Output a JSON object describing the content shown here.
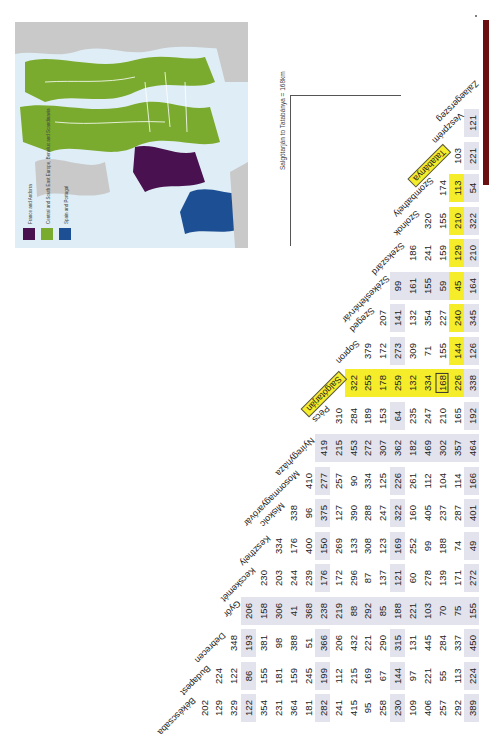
{
  "map": {
    "legend": [
      {
        "label": "France and Andorra",
        "color": "#4a1150"
      },
      {
        "label": "Central and South East Europe, Benelux and Scandinavia",
        "color": "#7aab2e"
      },
      {
        "label": "Spain and Portugal",
        "color": "#1d4f94"
      }
    ],
    "sea_color": "#dfeef6",
    "land_color": "#c9c9c9"
  },
  "note": "Salgótarján to Tatabánya = 168km",
  "accent_colors": {
    "highlight": "#f5ec2a",
    "band": "#e3e3ee",
    "bar": "#6b1010"
  },
  "table": {
    "cities": [
      "Békéscsaba",
      "Budapest",
      "Debrecen",
      "Győr",
      "Kecskemét",
      "Keszthely",
      "Miskolc",
      "Mosonmagyaróvár",
      "Nyíregyháza",
      "Pécs",
      "Salgótarján",
      "Sopron",
      "Szeged",
      "Székesfehérvár",
      "Szekszárd",
      "Szolnok",
      "Szombathely",
      "Tatabánya",
      "Veszprém",
      "Zalaegerszeg"
    ],
    "columns": [
      {
        "city": "Békéscsaba",
        "values": [
          "202",
          "129",
          "329",
          "122",
          "354",
          "231",
          "364",
          "181",
          "282",
          "241",
          "415",
          "95",
          "258",
          "230",
          "109",
          "406",
          "257",
          "292",
          "389"
        ]
      },
      {
        "city": "Budapest",
        "values": [
          "224",
          "122",
          "86",
          "155",
          "181",
          "159",
          "245",
          "199",
          "112",
          "215",
          "169",
          "67",
          "144",
          "97",
          "221",
          "55",
          "113",
          "224"
        ]
      },
      {
        "city": "Debrecen",
        "values": [
          "348",
          "193",
          "381",
          "98",
          "388",
          "51",
          "366",
          "206",
          "432",
          "221",
          "290",
          "315",
          "131",
          "445",
          "284",
          "337",
          "450"
        ]
      },
      {
        "city": "Győr",
        "values": [
          "206",
          "158",
          "306",
          "41",
          "368",
          "238",
          "219",
          "88",
          "292",
          "85",
          "188",
          "221",
          "103",
          "70",
          "75",
          "155"
        ]
      },
      {
        "city": "Kecskemét",
        "values": [
          "230",
          "203",
          "244",
          "239",
          "176",
          "172",
          "296",
          "87",
          "137",
          "121",
          "60",
          "278",
          "139",
          "171",
          "272"
        ]
      },
      {
        "city": "Keszthely",
        "values": [
          "334",
          "176",
          "400",
          "150",
          "269",
          "133",
          "308",
          "123",
          "169",
          "252",
          "99",
          "188",
          "74",
          "49"
        ]
      },
      {
        "city": "Miskolc",
        "values": [
          "338",
          "96",
          "375",
          "127",
          "390",
          "288",
          "247",
          "322",
          "160",
          "405",
          "237",
          "287",
          "401"
        ]
      },
      {
        "city": "Mosonmagyaróvár",
        "values": [
          "410",
          "277",
          "257",
          "90",
          "334",
          "125",
          "226",
          "261",
          "112",
          "104",
          "114",
          "166"
        ]
      },
      {
        "city": "Nyíregyháza",
        "values": [
          "419",
          "215",
          "453",
          "272",
          "307",
          "362",
          "182",
          "469",
          "302",
          "357",
          "464"
        ]
      },
      {
        "city": "Pécs",
        "values": [
          "310",
          "284",
          "189",
          "153",
          "64",
          "235",
          "247",
          "210",
          "165",
          "192"
        ]
      },
      {
        "city": "Salgótarján",
        "values": [
          "322",
          "255",
          "178",
          "259",
          "132",
          "334",
          "168",
          "226",
          "338"
        ]
      },
      {
        "city": "Sopron",
        "values": [
          "379",
          "172",
          "273",
          "309",
          "71",
          "155",
          "144",
          "126"
        ]
      },
      {
        "city": "Szeged",
        "values": [
          "207",
          "141",
          "132",
          "354",
          "227",
          "240",
          "345"
        ]
      },
      {
        "city": "Székesfehérvár",
        "values": [
          "99",
          "161",
          "155",
          "59",
          "45",
          "164"
        ]
      },
      {
        "city": "Szekszárd",
        "values": [
          "186",
          "241",
          "159",
          "129",
          "210"
        ]
      },
      {
        "city": "Szolnok",
        "values": [
          "320",
          "155",
          "210",
          "322"
        ]
      },
      {
        "city": "Szombathely",
        "values": [
          "174",
          "113",
          "54"
        ]
      },
      {
        "city": "Tatabánya",
        "values": [
          "103",
          "221"
        ]
      },
      {
        "city": "Veszprém",
        "values": [
          "121"
        ]
      }
    ],
    "highlighted": {
      "from": "Salgótarján",
      "to": "Tatabánya",
      "distance": "168"
    }
  }
}
